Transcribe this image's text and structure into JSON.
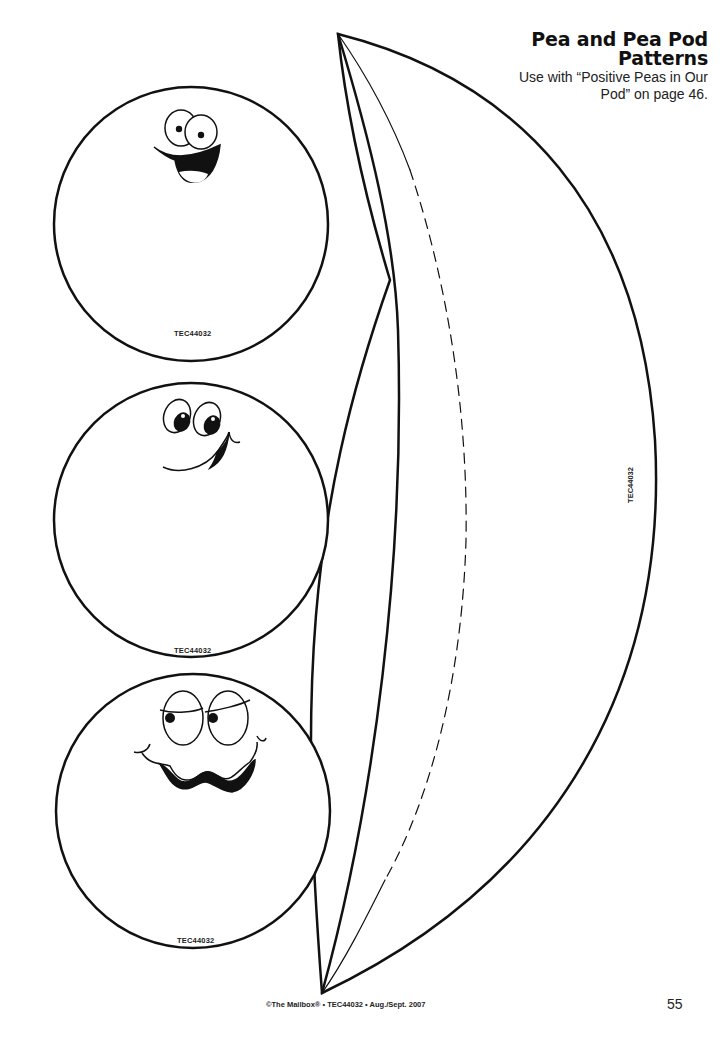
{
  "header": {
    "title_line1": "Pea and Pea Pod",
    "title_line2": "Patterns",
    "subtitle_line1": "Use with “Positive Peas in Our",
    "subtitle_line2": "Pod” on page 46."
  },
  "peas": [
    {
      "face": "happy-laughing",
      "code": "TEC44032"
    },
    {
      "face": "shy-smile",
      "code": "TEC44032"
    },
    {
      "face": "skeptical-wavy-mouth",
      "code": "TEC44032"
    }
  ],
  "pod": {
    "code": "TEC44032",
    "fold_line": "dashed"
  },
  "footer": {
    "credit": "©The Mailbox® • TEC44032 • Aug./Sept. 2007",
    "page_number": "55"
  },
  "colors": {
    "ink": "#111111",
    "paper": "#ffffff"
  }
}
